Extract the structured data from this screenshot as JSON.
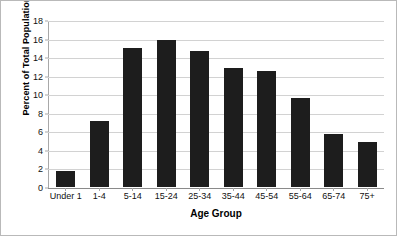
{
  "chart_data": {
    "type": "bar",
    "title": "",
    "xlabel": "Age Group",
    "ylabel": "Percent of Total Population",
    "categories": [
      "Under 1",
      "1-4",
      "5-14",
      "15-24",
      "25-34",
      "35-44",
      "45-54",
      "55-64",
      "65-74",
      "75+"
    ],
    "values": [
      1.7,
      7.1,
      15.0,
      15.8,
      14.7,
      12.8,
      12.5,
      9.6,
      5.7,
      4.9
    ],
    "ylim": [
      0,
      18
    ],
    "yticks": [
      0,
      2,
      4,
      6,
      8,
      10,
      12,
      14,
      16,
      18
    ],
    "ytick_labels": [
      "0",
      "2",
      "4",
      "6",
      "8",
      "10",
      "12",
      "14",
      "16",
      "18"
    ],
    "grid": true,
    "legend": "none",
    "bar_color": "#1d1d1d",
    "gridline_color": "#d2d2d2",
    "axis_color": "#8a8a8a",
    "background_color": "#ffffff"
  }
}
